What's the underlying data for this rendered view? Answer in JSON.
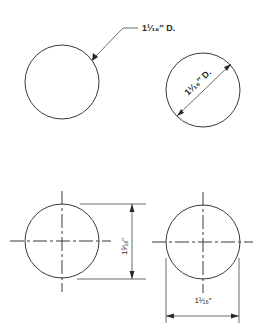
{
  "figure": {
    "type": "technical-drawing",
    "colors": {
      "background": "#ffffff",
      "line": "#3a3a3a",
      "text": "#2a2a2a"
    }
  },
  "views": [
    {
      "id": "leader-dimension",
      "description": "Circle dimensioned with leader line",
      "label": "1¹⁄₁₆″ D."
    },
    {
      "id": "diagonal-dimension",
      "description": "Circle dimensioned with diagonal diameter line",
      "label": "1¹⁄₁₆″ D."
    },
    {
      "id": "vertical-dimension",
      "description": "Circle with centerlines, dimensioned vertically with extension lines",
      "label": "1¹⁄₁₆″"
    },
    {
      "id": "horizontal-dimension",
      "description": "Circle with centerlines, dimensioned horizontally with extension lines",
      "label": "1¹⁄₁₆″"
    }
  ]
}
